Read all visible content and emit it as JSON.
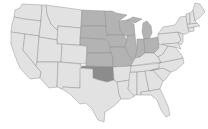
{
  "map": {
    "title": "",
    "type": "choropleth",
    "region": "United States",
    "colors": {
      "default": "#e2e2e2",
      "midwest": "#b3b3b3",
      "highlight": "#8c8c8c",
      "border": "#8a8a8a",
      "background": "#ffffff"
    },
    "highlighted_group": [
      "ND",
      "SD",
      "NE",
      "KS",
      "MN",
      "IA",
      "MO",
      "WI",
      "IL",
      "IN",
      "MI",
      "OH"
    ],
    "emphasized_state": "OK"
  }
}
